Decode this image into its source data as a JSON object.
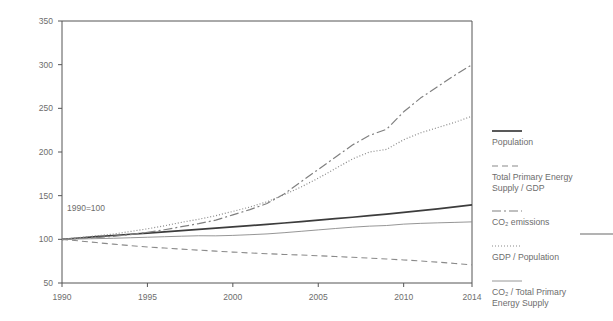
{
  "figure": {
    "background_color": "#ffffff",
    "annotation": "1990=100",
    "axis_color": "#555555",
    "text_color": "#6d6d6d"
  },
  "chart_data": {
    "type": "line",
    "title": "",
    "subtitle": "",
    "xlabel": "",
    "ylabel": "",
    "annotation": "1990=100",
    "grid": false,
    "legend_position": "right",
    "xlim": [
      1990,
      2014
    ],
    "ylim": [
      50,
      350
    ],
    "x_ticks": [
      1990,
      1995,
      2000,
      2005,
      2010,
      2014
    ],
    "y_ticks": [
      50,
      100,
      150,
      200,
      250,
      300,
      350
    ],
    "x": [
      1990,
      1991,
      1992,
      1993,
      1994,
      1995,
      1996,
      1997,
      1998,
      1999,
      2000,
      2001,
      2002,
      2003,
      2004,
      2005,
      2006,
      2007,
      2008,
      2009,
      2010,
      2011,
      2012,
      2013,
      2014
    ],
    "series": [
      {
        "name": "Population",
        "style": "solid",
        "color": "#3c3c3c",
        "width": 1.7,
        "values": [
          100,
          101.5,
          103,
          104.4,
          105.8,
          107.2,
          108.6,
          110,
          111.4,
          112.8,
          114.2,
          115.7,
          117.2,
          118.7,
          120.3,
          121.9,
          123.6,
          125.3,
          127.1,
          128.9,
          130.8,
          132.8,
          134.9,
          137.1,
          139.4
        ]
      },
      {
        "name": "Total Primary Energy Supply / GDP",
        "style": "dashed",
        "color": "#8a8a8a",
        "width": 1.1,
        "values": [
          100,
          98.2,
          96.3,
          94.5,
          92.8,
          91.3,
          90.0,
          88.8,
          87.6,
          86.5,
          85.4,
          84.4,
          83.5,
          82.7,
          82.0,
          81.2,
          80.3,
          79.4,
          78.5,
          77.5,
          76.4,
          75.2,
          73.9,
          72.4,
          70.8
        ]
      },
      {
        "name": "CO2 emissions",
        "style": "dashdot",
        "color": "#808080",
        "width": 1.2,
        "values": [
          100,
          101,
          102,
          103.5,
          105.5,
          108,
          111,
          114.5,
          118,
          122,
          128,
          134,
          141,
          152,
          166,
          180,
          194,
          208,
          219,
          226,
          246,
          262,
          275,
          288,
          300
        ]
      },
      {
        "name": "GDP / Population",
        "style": "dotted",
        "color": "#8a8a8a",
        "width": 1.2,
        "values": [
          100,
          102,
          104,
          106,
          109,
          112,
          115.5,
          119.5,
          123,
          127,
          132,
          137,
          143,
          151,
          160,
          170,
          181,
          192,
          200,
          203,
          214,
          222,
          228,
          234,
          241
        ]
      },
      {
        "name": "CO2 / Total Primary Energy Supply",
        "style": "solid-thin",
        "color": "#8a8a8a",
        "width": 0.9,
        "values": [
          100,
          100.4,
          100.8,
          101.2,
          101.8,
          102.4,
          103.0,
          103.6,
          104.1,
          104.0,
          104.5,
          105.3,
          106.2,
          107.6,
          109.2,
          110.8,
          112.4,
          113.9,
          115.1,
          115.8,
          117.4,
          118.3,
          118.9,
          119.4,
          120.0
        ]
      }
    ]
  },
  "axis": {
    "y_tick_labels": [
      "350",
      "300",
      "250",
      "200",
      "150",
      "100",
      "50"
    ],
    "x_tick_labels": [
      "1990",
      "1995",
      "2000",
      "2005",
      "2010",
      "2014"
    ]
  },
  "legend": {
    "entries": [
      {
        "label": "Population",
        "style": "solid",
        "label_lines": [
          "Population"
        ]
      },
      {
        "label": "Total Primary Energy Supply / GDP",
        "style": "dashed",
        "label_lines": [
          "Total Primary Energy",
          "Supply / GDP"
        ]
      },
      {
        "label": "CO2 emissions",
        "style": "dashdot",
        "label_lines": [
          "CO₂ emissions"
        ]
      },
      {
        "label": "GDP / Population",
        "style": "dotted",
        "label_lines": [
          "GDP / Population"
        ]
      },
      {
        "label": "CO2 / Total Primary Energy Supply",
        "style": "solid-thin",
        "label_lines": [
          "CO₂ / Total Primary",
          "Energy Supply"
        ]
      }
    ]
  }
}
